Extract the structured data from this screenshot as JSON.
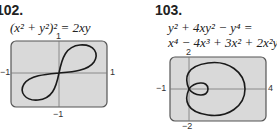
{
  "problems": [
    {
      "number": "102.",
      "equation": "(x² + y²)² = 2xy",
      "graph": {
        "xmin": "−1",
        "xmax": "1",
        "ymin": "−1",
        "ymax": "1",
        "curve": "lemniscate"
      }
    },
    {
      "number": "103.",
      "equation_line1": "y² + 4xy² − y⁴ =",
      "equation_line2": "x⁴ − 4x³ + 3x² + 2x²y²",
      "graph": {
        "xmin": "−1",
        "xmax": "4",
        "ymin": "−2",
        "ymax": "2",
        "curve": "limaçon-like"
      }
    }
  ],
  "colors": {
    "plot_bg": "#d9d9d9",
    "frame": "#555555",
    "curve": "#1a1a1a"
  }
}
